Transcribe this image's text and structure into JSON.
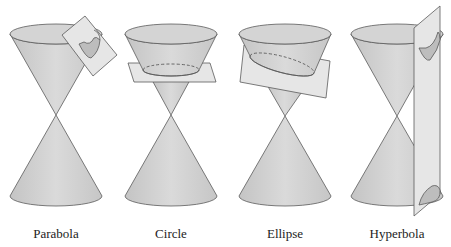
{
  "colors": {
    "cone_fill": "#cfcfcf",
    "cone_stroke": "#5a5a5a",
    "plane_fill": "#e6e6e6",
    "plane_stroke": "#5a5a5a",
    "section_fill": "#bdbdbd",
    "background": "#ffffff"
  },
  "panels": [
    {
      "id": "parabola",
      "label": "Parabola",
      "cx": 56
    },
    {
      "id": "circle",
      "label": "Circle",
      "cx": 171
    },
    {
      "id": "ellipse",
      "label": "Ellipse",
      "cx": 285
    },
    {
      "id": "hyperbola",
      "label": "Hyperbola",
      "cx": 397
    }
  ]
}
